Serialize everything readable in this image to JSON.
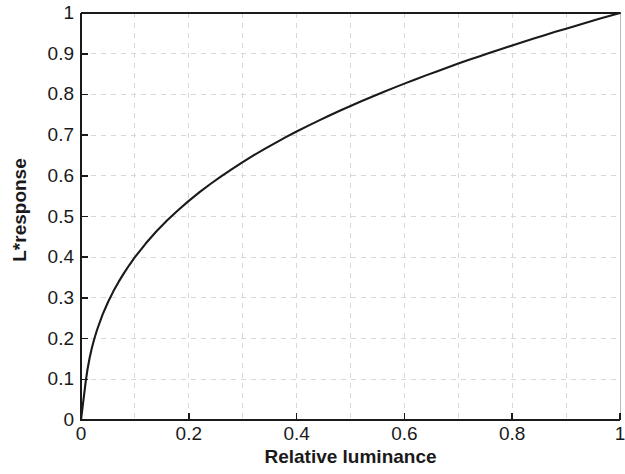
{
  "chart_data": {
    "type": "line",
    "title": "",
    "xlabel": "Relative luminance",
    "ylabel": "L*response",
    "xlim": [
      0,
      1
    ],
    "ylim": [
      0,
      1
    ],
    "grid": true,
    "legend": null,
    "legend_position": "none",
    "line_color": "#1a1a1a",
    "grid_color": "#d8d8d8",
    "axis_color": "#1a1a1a",
    "background_color": "#ffffff",
    "xticks": [
      0,
      0.2,
      0.4,
      0.6,
      0.8,
      1
    ],
    "xtick_labels": [
      "0",
      "0.2",
      "0.4",
      "0.6",
      "0.8",
      "1"
    ],
    "yticks": [
      0,
      0.1,
      0.2,
      0.3,
      0.4,
      0.5,
      0.6,
      0.7,
      0.8,
      0.9,
      1
    ],
    "ytick_labels": [
      "0",
      "0.1",
      "0.2",
      "0.3",
      "0.4",
      "0.5",
      "0.6",
      "0.7",
      "0.8",
      "0.9",
      "1"
    ],
    "x_minor_gridlines": [
      0.1,
      0.3,
      0.5,
      0.7,
      0.9
    ],
    "series": [
      {
        "name": "CIE L* lightness response",
        "x": [
          0,
          0.002,
          0.004,
          0.006,
          0.008,
          0.008856,
          0.012,
          0.016,
          0.02,
          0.025,
          0.03,
          0.04,
          0.05,
          0.06,
          0.07,
          0.08,
          0.09,
          0.1,
          0.12,
          0.14,
          0.16,
          0.18,
          0.2,
          0.22,
          0.24,
          0.26,
          0.28,
          0.3,
          0.32,
          0.34,
          0.36,
          0.38,
          0.4,
          0.42,
          0.44,
          0.46,
          0.48,
          0.5,
          0.52,
          0.54,
          0.56,
          0.58,
          0.6,
          0.62,
          0.64,
          0.66,
          0.68,
          0.7,
          0.72,
          0.74,
          0.76,
          0.78,
          0.8,
          0.82,
          0.84,
          0.86,
          0.88,
          0.9,
          0.92,
          0.94,
          0.96,
          0.98,
          1
        ],
        "y": [
          0,
          0.0181,
          0.0361,
          0.0542,
          0.0723,
          0.08,
          0.1037,
          0.1274,
          0.1471,
          0.1679,
          0.1858,
          0.2163,
          0.2418,
          0.2641,
          0.284,
          0.3021,
          0.3187,
          0.3342,
          0.3623,
          0.3874,
          0.41,
          0.4307,
          0.4499,
          0.4677,
          0.4845,
          0.5003,
          0.5153,
          0.5295,
          0.5431,
          0.5561,
          0.5686,
          0.5806,
          0.5922,
          0.6034,
          0.6142,
          0.6247,
          0.6349,
          0.6448,
          0.6544,
          0.6638,
          0.6729,
          0.6819,
          0.6906,
          0.6992,
          0.7075,
          0.7157,
          0.7238,
          0.7317,
          0.7394,
          0.747,
          0.7545,
          0.7618,
          0.7691,
          0.7762,
          0.7832,
          0.7901,
          0.7969,
          0.8035,
          0.8101,
          0.8166,
          0.8231,
          0.8294,
          0.8356
        ]
      }
    ]
  },
  "axes": {
    "y_axis_title": "L*response",
    "x_axis_title": "Relative luminance"
  }
}
